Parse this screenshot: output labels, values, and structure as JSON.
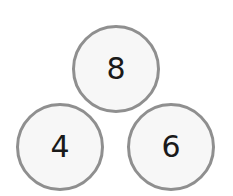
{
  "number_bond": {
    "whole": "8",
    "parts": [
      "4",
      "6"
    ]
  },
  "colors": {
    "circle_border": "#8f8f8f",
    "circle_fill": "#f7f7f7",
    "text": "#1a1a1a"
  }
}
